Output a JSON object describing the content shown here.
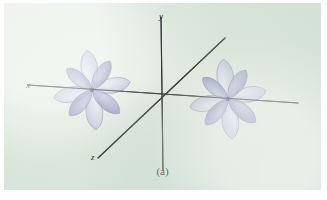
{
  "figure": {
    "caption": "(a)",
    "background_color": "#dfe9de",
    "plate_border_color": "#ffffff"
  },
  "axes": {
    "line_color": "#2c2c2c",
    "origin": {
      "x": 162,
      "y": 97
    },
    "items": [
      {
        "name": "x-axis",
        "label": "x",
        "label_x": 22,
        "label_y": 78,
        "x1": 28,
        "y1": 85,
        "x2": 298,
        "y2": 103
      },
      {
        "name": "y-axis",
        "label": "y",
        "label_x": 155,
        "label_y": 9,
        "x1": 161,
        "y1": 17,
        "x2": 163,
        "y2": 170
      },
      {
        "name": "z-axis",
        "label": "z",
        "label_x": 87,
        "label_y": 150,
        "x1": 225,
        "y1": 38,
        "x2": 98,
        "y2": 158
      }
    ]
  },
  "orbitals": {
    "description": "two identical multi-lobed d-orbital sets centred on the x axis",
    "lobe_fill": "#c2c7e0",
    "lobe_fill_dark": "#8f95bd",
    "lobe_stroke": "#6a6f9e",
    "sets": [
      {
        "name": "left-orbital-set",
        "cx": 92,
        "cy": 90,
        "lobes": [
          {
            "angle": -97,
            "len": 40,
            "w": 21,
            "shade": "light"
          },
          {
            "angle": -58,
            "len": 34,
            "w": 17,
            "shade": "dark"
          },
          {
            "angle": -12,
            "len": 39,
            "w": 19,
            "shade": "light"
          },
          {
            "angle": 40,
            "len": 36,
            "w": 18,
            "shade": "dark"
          },
          {
            "angle": 84,
            "len": 40,
            "w": 21,
            "shade": "light"
          },
          {
            "angle": 168,
            "len": 39,
            "w": 19,
            "shade": "light"
          },
          {
            "angle": 131,
            "len": 34,
            "w": 17,
            "shade": "dark"
          },
          {
            "angle": -140,
            "len": 33,
            "w": 16,
            "shade": "dark"
          }
        ]
      },
      {
        "name": "right-orbital-set",
        "cx": 228,
        "cy": 99,
        "lobes": [
          {
            "angle": -97,
            "len": 40,
            "w": 21,
            "shade": "light"
          },
          {
            "angle": -58,
            "len": 34,
            "w": 17,
            "shade": "dark"
          },
          {
            "angle": -12,
            "len": 39,
            "w": 19,
            "shade": "light"
          },
          {
            "angle": 40,
            "len": 36,
            "w": 18,
            "shade": "dark"
          },
          {
            "angle": 84,
            "len": 40,
            "w": 21,
            "shade": "light"
          },
          {
            "angle": 168,
            "len": 39,
            "w": 19,
            "shade": "light"
          },
          {
            "angle": 131,
            "len": 34,
            "w": 17,
            "shade": "dark"
          },
          {
            "angle": -140,
            "len": 33,
            "w": 16,
            "shade": "dark"
          }
        ]
      }
    ]
  }
}
